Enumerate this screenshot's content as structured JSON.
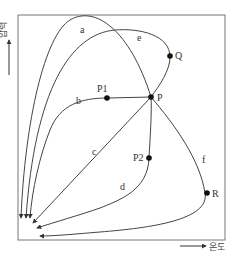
{
  "axes": {
    "y_label": "압력",
    "x_label": "온도"
  },
  "points": [
    {
      "name": "P",
      "label": "P"
    },
    {
      "name": "P1",
      "label": "P1"
    },
    {
      "name": "P2",
      "label": "P2"
    },
    {
      "name": "Q",
      "label": "Q"
    },
    {
      "name": "R",
      "label": "R"
    }
  ],
  "paths": [
    {
      "name": "a",
      "label": "a"
    },
    {
      "name": "b",
      "label": "b"
    },
    {
      "name": "c",
      "label": "c"
    },
    {
      "name": "d",
      "label": "d"
    },
    {
      "name": "e",
      "label": "e"
    },
    {
      "name": "f",
      "label": "f"
    }
  ],
  "colors": {
    "line": "#444444",
    "frame": "#777777",
    "point": "#111111"
  }
}
